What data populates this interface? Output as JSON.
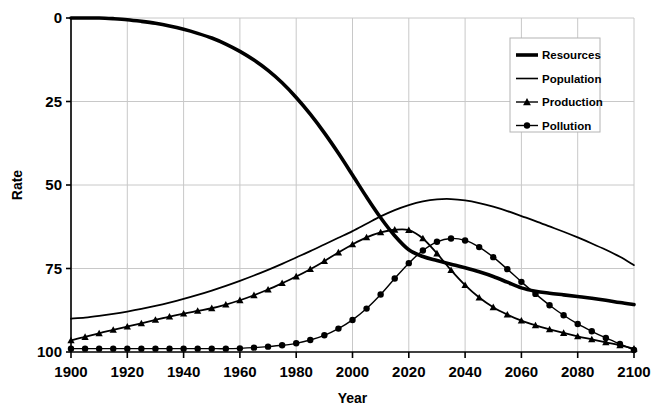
{
  "chart_data": {
    "type": "line",
    "title": "",
    "xlabel": "Year",
    "ylabel": "Rate",
    "xlim": [
      1900,
      2100
    ],
    "ylim": [
      0,
      100
    ],
    "xticks": [
      1900,
      1920,
      1940,
      1960,
      1980,
      2000,
      2020,
      2040,
      2060,
      2080,
      2100
    ],
    "yticks": [
      0,
      25,
      50,
      75,
      100
    ],
    "grid": true,
    "legend_position": "top-right",
    "x": [
      1900,
      1905,
      1910,
      1915,
      1920,
      1925,
      1930,
      1935,
      1940,
      1945,
      1950,
      1955,
      1960,
      1965,
      1970,
      1975,
      1980,
      1985,
      1990,
      1995,
      2000,
      2005,
      2010,
      2015,
      2020,
      2025,
      2030,
      2035,
      2040,
      2045,
      2050,
      2055,
      2060,
      2065,
      2070,
      2075,
      2080,
      2085,
      2090,
      2095,
      2100
    ],
    "series": [
      {
        "name": "Resources",
        "color": "#000000",
        "line_width": 3.6,
        "marker": "none",
        "values": [
          100,
          100,
          100,
          99.8,
          99.5,
          99,
          98.4,
          97.6,
          96.6,
          95.4,
          94,
          92.2,
          90,
          87.4,
          84.3,
          80.6,
          76.2,
          71.2,
          65.6,
          59.5,
          53,
          46.4,
          40.2,
          34.8,
          30.6,
          28.6,
          27.4,
          26.3,
          25.2,
          24.0,
          22.6,
          20.9,
          19.2,
          18.2,
          17.6,
          17.1,
          16.6,
          16.1,
          15.5,
          14.8,
          14.2
        ]
      },
      {
        "name": "Population",
        "color": "#000000",
        "line_width": 1.8,
        "marker": "none",
        "values": [
          10,
          10.3,
          10.8,
          11.4,
          12.1,
          12.9,
          13.8,
          14.8,
          15.9,
          17.1,
          18.4,
          19.8,
          21.3,
          22.9,
          24.6,
          26.4,
          28.3,
          30.2,
          32.2,
          34.2,
          36.2,
          38.4,
          40.6,
          42.5,
          44.0,
          45.1,
          45.7,
          45.8,
          45.4,
          44.6,
          43.5,
          42.2,
          40.7,
          39.2,
          37.6,
          36.0,
          34.3,
          32.5,
          30.6,
          28.5,
          26.0
        ]
      },
      {
        "name": "Production",
        "color": "#000000",
        "line_width": 1.8,
        "marker": "triangle",
        "values": [
          3.5,
          4.5,
          5.6,
          6.6,
          7.6,
          8.6,
          9.6,
          10.6,
          11.5,
          12.3,
          13.1,
          14.2,
          15.5,
          17.0,
          18.7,
          20.6,
          22.6,
          24.8,
          27.2,
          29.8,
          32.2,
          34.3,
          35.8,
          36.6,
          36.5,
          34.0,
          29.5,
          24.5,
          20.0,
          16.3,
          13.4,
          11.2,
          9.4,
          8.0,
          6.8,
          5.7,
          4.7,
          3.8,
          2.9,
          2.0,
          1.0
        ]
      },
      {
        "name": "Pollution",
        "color": "#000000",
        "line_width": 1.4,
        "marker": "circle",
        "values": [
          1.0,
          1.0,
          1.0,
          1.0,
          1.0,
          1.0,
          1.0,
          1.0,
          1.0,
          1.0,
          1.0,
          1.0,
          1.1,
          1.3,
          1.6,
          2.0,
          2.6,
          3.6,
          5.0,
          7.0,
          9.6,
          13.0,
          17.2,
          22.0,
          26.6,
          30.4,
          33.0,
          34.0,
          33.4,
          31.4,
          28.4,
          24.8,
          21.0,
          17.4,
          14.0,
          11.0,
          8.4,
          6.2,
          4.2,
          2.4,
          0.6
        ]
      }
    ]
  },
  "legend": {
    "entries": [
      {
        "label": "Resources",
        "marker": "none",
        "line_width": 3.6
      },
      {
        "label": "Population",
        "marker": "none",
        "line_width": 1.6
      },
      {
        "label": "Production",
        "marker": "triangle",
        "line_width": 1.4
      },
      {
        "label": "Pollution",
        "marker": "circle",
        "line_width": 1.4
      }
    ]
  },
  "axes": {
    "ylabel": "Rate",
    "xlabel": "Year",
    "ytick_labels": [
      "100",
      "75",
      "50",
      "25",
      "0"
    ],
    "xtick_labels": [
      "1900",
      "1920",
      "1940",
      "1960",
      "1980",
      "2000",
      "2020",
      "2040",
      "2060",
      "2080",
      "2100"
    ]
  },
  "colors": {
    "plot_line": "#000000",
    "grid": "#c8c8c8",
    "axis": "#000000",
    "background": "#ffffff",
    "legend_border": "#b4b4b4"
  }
}
